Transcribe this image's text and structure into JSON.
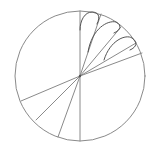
{
  "diagram": {
    "type": "circle-sector-construction",
    "stroke_color": "#8a8a8a",
    "dark_stroke_color": "#555555",
    "background": "#ffffff",
    "circle": {
      "cx": 80,
      "cy": 76,
      "r": 65
    },
    "rays": [
      {
        "x2": 80,
        "y2": 11
      },
      {
        "x2": 101,
        "y2": 14
      },
      {
        "x2": 121,
        "y2": 27
      },
      {
        "x2": 136,
        "y2": 43
      },
      {
        "x2": 142,
        "y2": 53
      },
      {
        "x2": 80,
        "y2": 141
      },
      {
        "x2": 58,
        "y2": 137
      },
      {
        "x2": 36,
        "y2": 120
      },
      {
        "x2": 21,
        "y2": 101
      }
    ],
    "inscribed_arcs": [
      {
        "d": "M 80 30 C 80 20, 85 12, 92 12 C 98 12, 101 16, 97 24"
      },
      {
        "d": "M 88 52 C 92 28, 108 20, 116 22 C 122 25, 121 30, 114 33"
      },
      {
        "d": "M 104 60 C 110 40, 126 34, 132 38 C 138 42, 137 47, 130 50"
      }
    ]
  }
}
